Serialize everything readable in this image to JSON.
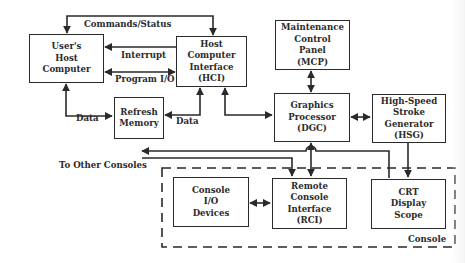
{
  "diagram": {
    "blocks": {
      "users_host": {
        "lines": [
          "User's",
          "Host",
          "Computer"
        ]
      },
      "hci": {
        "lines": [
          "Host",
          "Computer",
          "Interface",
          "(HCI)"
        ]
      },
      "refresh_memory": {
        "lines": [
          "Refresh",
          "Memory"
        ]
      },
      "mcp": {
        "lines": [
          "Maintenance",
          "Control",
          "Panel",
          "(MCP)"
        ]
      },
      "dgc": {
        "lines": [
          "Graphics",
          "Processor",
          "(DGC)"
        ]
      },
      "hsg": {
        "lines": [
          "High-Speed",
          "Stroke",
          "Generator",
          "(HSG)"
        ]
      },
      "console_io": {
        "lines": [
          "Console",
          "I/O",
          "Devices"
        ]
      },
      "rci": {
        "lines": [
          "Remote",
          "Console",
          "Interface",
          "(RCI)"
        ]
      },
      "crt": {
        "lines": [
          "CRT",
          "Display",
          "Scope"
        ]
      }
    },
    "labels": {
      "commands_status": "Commands/Status",
      "interrupt": "Interrupt",
      "program_io": "Program I/O",
      "data_left": "Data",
      "data_right": "Data",
      "to_other_consoles": "To Other Consoles",
      "console_group": "Console"
    },
    "connections": [
      {
        "from": "hci",
        "to": "users_host",
        "label": "Commands/Status",
        "direction": "bidirectional"
      },
      {
        "from": "hci",
        "to": "users_host",
        "label": "Interrupt",
        "direction": "forward"
      },
      {
        "from": "users_host",
        "to": "hci",
        "label": "Program I/O",
        "direction": "bidirectional"
      },
      {
        "from": "users_host",
        "to": "refresh_memory",
        "label": "Data",
        "direction": "bidirectional"
      },
      {
        "from": "hci",
        "to": "refresh_memory",
        "label": "Data",
        "direction": "bidirectional"
      },
      {
        "from": "hci",
        "to": "dgc",
        "direction": "bidirectional"
      },
      {
        "from": "mcp",
        "to": "dgc",
        "direction": "bidirectional"
      },
      {
        "from": "dgc",
        "to": "hsg",
        "direction": "bidirectional"
      },
      {
        "from": "dgc",
        "to": "rci",
        "direction": "bidirectional"
      },
      {
        "from": "hsg",
        "to": "crt",
        "direction": "forward"
      },
      {
        "from": "console_io",
        "to": "rci",
        "direction": "bidirectional"
      },
      {
        "from": "crt",
        "to": "other_consoles",
        "direction": "forward"
      },
      {
        "from": "other_consoles",
        "to": "rci",
        "direction": "forward"
      }
    ]
  }
}
